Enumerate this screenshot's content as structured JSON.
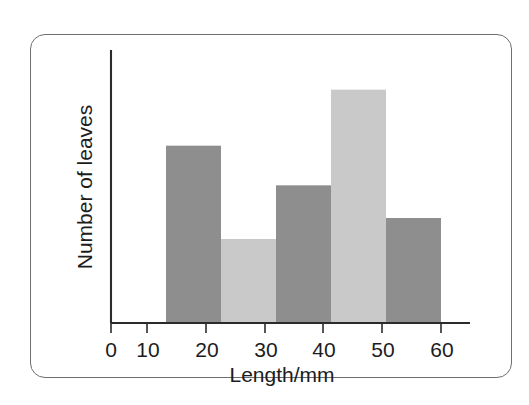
{
  "figure": {
    "background_color": "#ffffff",
    "frame_color": "#6f6f73",
    "axis_color": "#2b2b2b"
  },
  "chart_data": {
    "type": "bar",
    "title": "",
    "subtitle": "",
    "xlabel": "Length/mm",
    "ylabel": "Number of leaves",
    "categories": [
      "10-20",
      "20-30",
      "30-40",
      "40-50",
      "50-60"
    ],
    "bin_edges": [
      10,
      20,
      30,
      40,
      50,
      60
    ],
    "values": [
      7.6,
      3.6,
      5.9,
      10.0,
      4.5
    ],
    "bar_colors": [
      "#8e8e8e",
      "#c9c9c9",
      "#8e8e8e",
      "#c9c9c9",
      "#8e8e8e"
    ],
    "xlim": [
      0,
      65
    ],
    "ylim": [
      0,
      11.7
    ],
    "xticks": [
      0,
      10,
      20,
      30,
      40,
      50,
      60
    ],
    "xtick_labels": [
      "0",
      "10",
      "20",
      "30",
      "40",
      "50",
      "60"
    ],
    "yticks": [],
    "ytick_labels": [],
    "grid": false,
    "legend": null,
    "legend_position": "none",
    "annotations": []
  },
  "axes": {
    "x_axis_label": "Length/mm",
    "y_axis_label": "Number of leaves",
    "tick_0": "0",
    "tick_10": "10",
    "tick_20": "20",
    "tick_30": "30",
    "tick_40": "40",
    "tick_50": "50",
    "tick_60": "60"
  }
}
